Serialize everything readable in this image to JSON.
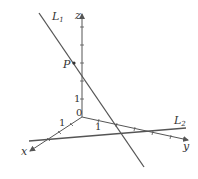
{
  "figure": {
    "axes": {
      "x_label": "x",
      "y_label": "y",
      "z_label": "z",
      "origin_label": "0",
      "unit_label_x": "1",
      "unit_label_y": "1",
      "unit_label_z": "1"
    },
    "lines": [
      {
        "name": "L",
        "subscript": "1"
      },
      {
        "name": "L",
        "subscript": "2"
      }
    ],
    "point": {
      "label": "P"
    },
    "colors": {
      "stroke": "#555555",
      "text": "#333333"
    }
  }
}
